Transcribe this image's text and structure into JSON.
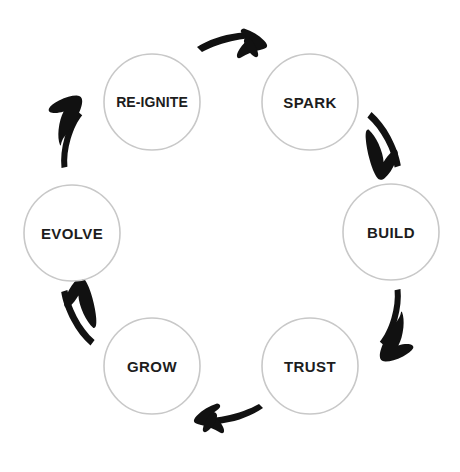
{
  "diagram": {
    "type": "cycle",
    "title": "",
    "background_color": "#ffffff",
    "node_fill_color": "#ffffff",
    "node_stroke_color": "#c8c8c8",
    "label_color": "#1d1d1d",
    "arrow_color": "#111111",
    "direction": "clockwise",
    "node_count": "6",
    "nodes": [
      {
        "id": "re-ignite",
        "label": "RE-IGNITE",
        "cx": 152,
        "cy": 102,
        "r": 48,
        "order": 6
      },
      {
        "id": "spark",
        "label": "SPARK",
        "cx": 310,
        "cy": 102,
        "r": 48,
        "order": 1
      },
      {
        "id": "build",
        "label": "BUILD",
        "cx": 391,
        "cy": 232,
        "r": 48,
        "order": 2
      },
      {
        "id": "trust",
        "label": "TRUST",
        "cx": 310,
        "cy": 366,
        "r": 48,
        "order": 3
      },
      {
        "id": "grow",
        "label": "GROW",
        "cx": 152,
        "cy": 366,
        "r": 48,
        "order": 4
      },
      {
        "id": "evolve",
        "label": "EVOLVE",
        "cx": 72,
        "cy": 233,
        "r": 48,
        "order": 5
      }
    ],
    "connectors": [
      {
        "id": "arrow-reignite-to-spark",
        "from": "re-ignite",
        "to": "spark",
        "direction": "right"
      },
      {
        "id": "arrow-spark-to-build",
        "from": "spark",
        "to": "build",
        "direction": "down-right"
      },
      {
        "id": "arrow-build-to-trust",
        "from": "build",
        "to": "trust",
        "direction": "down-left"
      },
      {
        "id": "arrow-trust-to-grow",
        "from": "trust",
        "to": "grow",
        "direction": "left"
      },
      {
        "id": "arrow-grow-to-evolve",
        "from": "grow",
        "to": "evolve",
        "direction": "up-left"
      },
      {
        "id": "arrow-evolve-to-reignite",
        "from": "evolve",
        "to": "re-ignite",
        "direction": "up-right"
      }
    ]
  }
}
